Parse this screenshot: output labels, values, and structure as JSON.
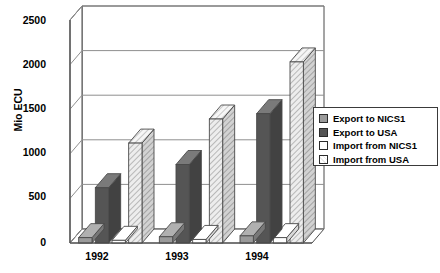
{
  "chart_data": {
    "type": "bar",
    "title": "",
    "subtitle": "",
    "xlabel": "",
    "ylabel": "Mio ECU",
    "categories": [
      "1992",
      "1993",
      "1994"
    ],
    "ylim": [
      0,
      2500
    ],
    "yticks": [
      "0",
      "500",
      "1000",
      "1500",
      "2000",
      "2500"
    ],
    "ytick_values": [
      0,
      500,
      1000,
      1500,
      2000,
      2500
    ],
    "grid": true,
    "grid_axis": "y",
    "legend_position": "right",
    "style": "3d-column",
    "series": [
      {
        "name": "Export to NICS1",
        "values": [
          60,
          70,
          80
        ],
        "color": "#9a9a9a",
        "fill": "solid"
      },
      {
        "name": "Export to USA",
        "values": [
          620,
          880,
          1450
        ],
        "color": "#555555",
        "fill": "solid"
      },
      {
        "name": "Import from NICS1",
        "values": [
          30,
          40,
          60
        ],
        "color": "#ffffff",
        "fill": "solid"
      },
      {
        "name": "Import from USA",
        "values": [
          1120,
          1390,
          2030
        ],
        "color": "#e8e8e8",
        "fill": "hatch"
      }
    ]
  },
  "legend": {
    "items": [
      {
        "label": "Export to NICS1"
      },
      {
        "label": "Export to USA"
      },
      {
        "label": "Import from NICS1"
      },
      {
        "label": "Import from USA"
      }
    ]
  }
}
